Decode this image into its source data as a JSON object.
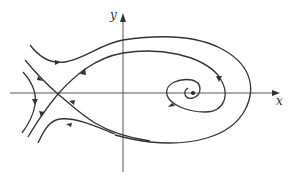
{
  "diagram": {
    "type": "phase-portrait",
    "axes": {
      "x_label": "x",
      "y_label": "y"
    },
    "features": {
      "saddle_point": "left of y-axis on x-axis",
      "spiral_focus": "right of y-axis on x-axis",
      "homoclinic_like_loop": "trajectory leaving saddle, circling the focus, returning to saddle"
    },
    "colors": {
      "stroke": "#333333",
      "background": "#ffffff"
    }
  }
}
